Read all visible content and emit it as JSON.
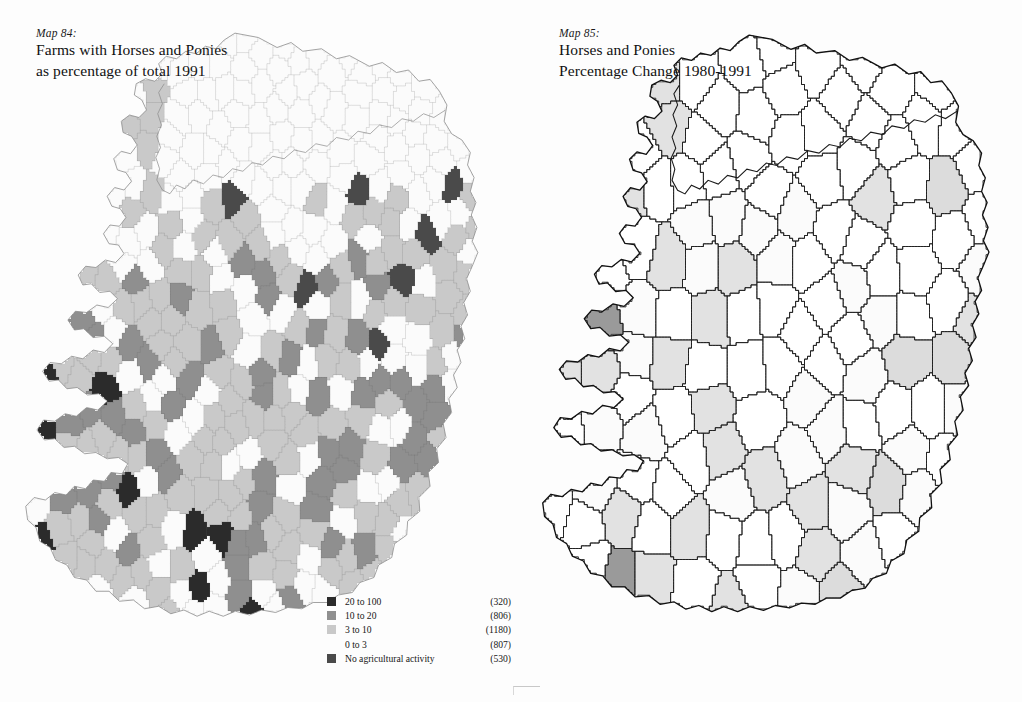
{
  "page": {
    "background": "#fdfdfd"
  },
  "maps": [
    {
      "label": "Map 84:",
      "title_line1": "Farms with Horses and Ponies",
      "title_line2": "as percentage of total 1991",
      "region": "Ireland",
      "legend": [
        {
          "label": "20 to 100",
          "count": "(320)",
          "color": "#2b2b2b"
        },
        {
          "label": "10 to 20",
          "count": "(806)",
          "color": "#8f8f8f"
        },
        {
          "label": "3 to 10",
          "count": "(1180)",
          "color": "#c9c9c9"
        },
        {
          "label": "0 to 3",
          "count": "(807)",
          "color": "#fbfbfb"
        },
        {
          "label": "No agricultural activity",
          "count": "(530)",
          "color": "#4a4a4a"
        }
      ]
    },
    {
      "label": "Map 85:",
      "title_line1": "Horses and Ponies",
      "title_line2": "Percentage Change 1980-1991",
      "region": "Ireland",
      "legend": [
        {
          "label": "41 plus",
          "count": "(11)",
          "color": "#dcdcdc"
        },
        {
          "label": "0 to 41",
          "count": "(36)",
          "color": "#fbfbfb"
        },
        {
          "label": "-26 to 0",
          "count": "(54)",
          "color": "#ffffff"
        },
        {
          "label": "-46 to -26",
          "count": "(32)",
          "color": "#e2e2e2"
        },
        {
          "label": "-78 to -46",
          "count": "(23)",
          "color": "#9a9a9a"
        }
      ]
    }
  ],
  "chart_data": [
    {
      "type": "map",
      "title": "Farms with Horses and Ponies as percentage of total 1991",
      "subtitle": "Map 84:",
      "region": "Ireland",
      "classes": [
        "20 to 100",
        "10 to 20",
        "3 to 10",
        "0 to 3",
        "No agricultural activity"
      ],
      "counts": [
        320,
        806,
        1180,
        807,
        530
      ],
      "colors": [
        "#2b2b2b",
        "#8f8f8f",
        "#c9c9c9",
        "#fbfbfb",
        "#4a4a4a"
      ],
      "unit": "percent of farms",
      "legend_position": "bottom-right",
      "notes": "Fine-grained district electoral division choropleth; Northern Ireland unshaded (no data)."
    },
    {
      "type": "map",
      "title": "Horses and Ponies Percentage Change 1980-1991",
      "subtitle": "Map 85:",
      "region": "Ireland",
      "classes": [
        "41 plus",
        "0 to 41",
        "-26 to 0",
        "-46 to -26",
        "-78 to -46"
      ],
      "counts": [
        11,
        36,
        54,
        32,
        23
      ],
      "colors": [
        "#dcdcdc",
        "#fbfbfb",
        "#ffffff",
        "#e2e2e2",
        "#9a9a9a"
      ],
      "unit": "percentage change",
      "legend_position": "bottom-right",
      "notes": "Coarser rural district choropleth with outlined polygons; Northern Ireland unshaded (no data)."
    }
  ]
}
